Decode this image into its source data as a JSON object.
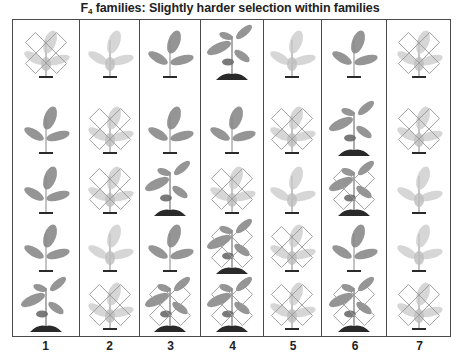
{
  "title": {
    "prefix": "F",
    "subscript": "4",
    "text": " families:  Slightly harder selection within families"
  },
  "legend_semantics": {
    "large": "tall plant with soil mound",
    "small": "small plant",
    "faded": "pale / faded plant",
    "crossed": "plant marked with an X (rejected)"
  },
  "colors": {
    "border": "#4a4a4a",
    "leaf_dark": "#8a8a8a",
    "leaf_faded": "#c8c8c8",
    "cross_outline": "#9a9a9a",
    "soil": "#2a2a2a",
    "text": "#222222"
  },
  "columns": [
    {
      "label": "1",
      "width": 67,
      "plants": [
        {
          "type": "faded",
          "crossed": true
        },
        {
          "type": "small",
          "crossed": false
        },
        {
          "type": "small",
          "crossed": false
        },
        {
          "type": "small",
          "crossed": false
        },
        {
          "type": "large",
          "crossed": false
        }
      ]
    },
    {
      "label": "2",
      "width": 61,
      "plants": [
        {
          "type": "faded",
          "crossed": false
        },
        {
          "type": "faded",
          "crossed": true
        },
        {
          "type": "faded",
          "crossed": true
        },
        {
          "type": "faded",
          "crossed": false
        },
        {
          "type": "faded",
          "crossed": true
        }
      ]
    },
    {
      "label": "3",
      "width": 61,
      "plants": [
        {
          "type": "small",
          "crossed": false
        },
        {
          "type": "small",
          "crossed": false
        },
        {
          "type": "large",
          "crossed": false
        },
        {
          "type": "small",
          "crossed": false
        },
        {
          "type": "large",
          "crossed": true
        }
      ]
    },
    {
      "label": "4",
      "width": 63,
      "plants": [
        {
          "type": "large",
          "crossed": false
        },
        {
          "type": "small",
          "crossed": false
        },
        {
          "type": "faded",
          "crossed": true
        },
        {
          "type": "large",
          "crossed": true
        },
        {
          "type": "large",
          "crossed": true
        }
      ]
    },
    {
      "label": "5",
      "width": 58,
      "plants": [
        {
          "type": "faded",
          "crossed": false
        },
        {
          "type": "faded",
          "crossed": true
        },
        {
          "type": "faded",
          "crossed": false
        },
        {
          "type": "faded",
          "crossed": true
        },
        {
          "type": "faded",
          "crossed": true
        }
      ]
    },
    {
      "label": "6",
      "width": 66,
      "plants": [
        {
          "type": "small",
          "crossed": false
        },
        {
          "type": "large",
          "crossed": false
        },
        {
          "type": "large",
          "crossed": true
        },
        {
          "type": "small",
          "crossed": false
        },
        {
          "type": "large",
          "crossed": true
        }
      ]
    },
    {
      "label": "7",
      "width": 63,
      "plants": [
        {
          "type": "faded",
          "crossed": true
        },
        {
          "type": "faded",
          "crossed": true
        },
        {
          "type": "faded",
          "crossed": false
        },
        {
          "type": "faded",
          "crossed": false
        },
        {
          "type": "faded",
          "crossed": true
        }
      ]
    }
  ],
  "row_tops": [
    2,
    78,
    138,
    196,
    254
  ]
}
